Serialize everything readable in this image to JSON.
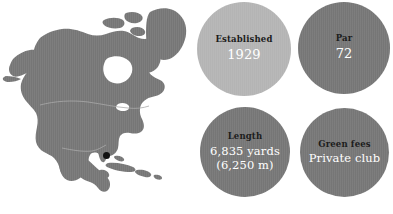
{
  "background_color": "#ffffff",
  "map": {
    "name": "north-america-map",
    "region": "North America",
    "land_color": "#767676",
    "water_color": "#ffffff",
    "marker": {
      "name": "location-marker",
      "color": "#111111",
      "location_hint": "Southeast Florida"
    }
  },
  "stats": [
    {
      "key": "established",
      "label": "Established",
      "value": "1929",
      "value_line2": "",
      "circle_color": "#b4b4b4",
      "label_color": "#1c1c1c",
      "value_color": "#ffffff"
    },
    {
      "key": "par",
      "label": "Par",
      "value": "72",
      "value_line2": "",
      "circle_color": "#767676",
      "label_color": "#1c1c1c",
      "value_color": "#ffffff"
    },
    {
      "key": "length",
      "label": "Length",
      "value": "6,835 yards",
      "value_line2": "(6,250 m)",
      "circle_color": "#767676",
      "label_color": "#1c1c1c",
      "value_color": "#ffffff"
    },
    {
      "key": "green-fees",
      "label": "Green fees",
      "value": "Private club",
      "value_line2": "",
      "circle_color": "#767676",
      "label_color": "#1c1c1c",
      "value_color": "#ffffff"
    }
  ]
}
